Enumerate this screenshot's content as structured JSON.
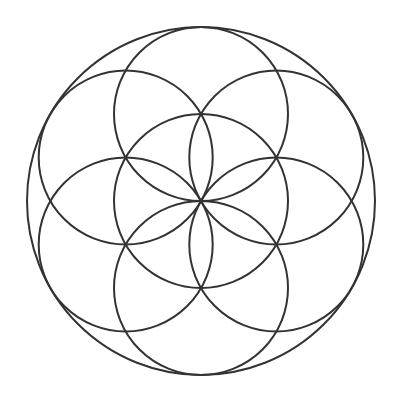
{
  "diagram": {
    "width": 405,
    "height": 399,
    "background": "#ffffff",
    "stroke_color": "#333333",
    "center": {
      "x": 201,
      "y": 201
    },
    "outer_circle": {
      "cx": 201,
      "cy": 201,
      "r": 174
    },
    "inner_radius": 87,
    "inner_circles": [
      {
        "name": "center",
        "cx": 201,
        "cy": 201
      },
      {
        "name": "top",
        "cx": 201,
        "cy": 114
      },
      {
        "name": "top-right",
        "cx": 276.3,
        "cy": 157.5
      },
      {
        "name": "bottom-right",
        "cx": 276.3,
        "cy": 244.5
      },
      {
        "name": "bottom",
        "cx": 201,
        "cy": 288
      },
      {
        "name": "bottom-left",
        "cx": 125.7,
        "cy": 244.5
      },
      {
        "name": "top-left",
        "cx": 125.7,
        "cy": 157.5
      }
    ]
  }
}
